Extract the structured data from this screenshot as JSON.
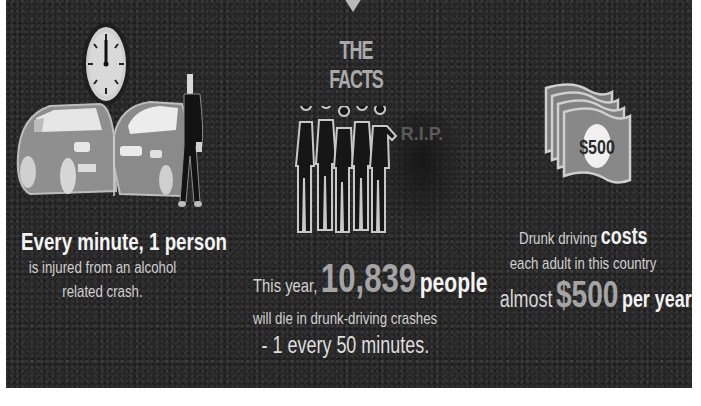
{
  "header": {
    "title": "THE FACTS"
  },
  "facts": [
    {
      "icon": "clock-car-crash-icon",
      "headline": "Every minute, 1 person",
      "line2": "is injured from an alcohol",
      "line3": "related crash."
    },
    {
      "icon": "people-silhouettes-tombstone-icon",
      "tombstone_text": "R.I.P.",
      "prefix": "This year,",
      "number": "10,839",
      "suffix": "people",
      "line2": "will die in drunk-driving crashes",
      "line3": "- 1 every 50 minutes."
    },
    {
      "icon": "money-stack-icon",
      "bill_label": "$500",
      "line1_prefix": "Drunk driving",
      "line1_emphasis": "costs",
      "line2": "each adult in this country",
      "line3_prefix": "almost",
      "line3_amount": "$500",
      "line3_suffix": "per year."
    }
  ],
  "colors": {
    "background": "#262626",
    "text": "#d8d8d8",
    "emphasis": "#f2f2f2",
    "number": "#a4a4a4",
    "border": "#ffffff"
  }
}
